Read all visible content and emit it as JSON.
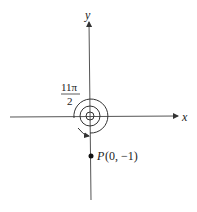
{
  "diagram": {
    "axes": {
      "x_label": "x",
      "y_label": "y"
    },
    "angle_label": {
      "numerator": "11π",
      "denominator": "2"
    },
    "point": {
      "name": "P",
      "coords": "(0, −1)"
    },
    "colors": {
      "stroke": "#333333",
      "background": "#ffffff"
    }
  }
}
